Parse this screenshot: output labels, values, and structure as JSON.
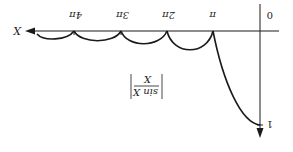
{
  "diagram": {
    "orientation": "rotated 180 degrees",
    "axis_x_label": "X",
    "origin_label": "0",
    "y_tick_label": "1",
    "x_ticks": [
      "π",
      "2π",
      "3π",
      "4π"
    ],
    "formula": {
      "numerator": "sin X",
      "denominator": "X"
    },
    "colors": {
      "stroke": "#1a1a1a",
      "background": "#ffffff"
    }
  }
}
